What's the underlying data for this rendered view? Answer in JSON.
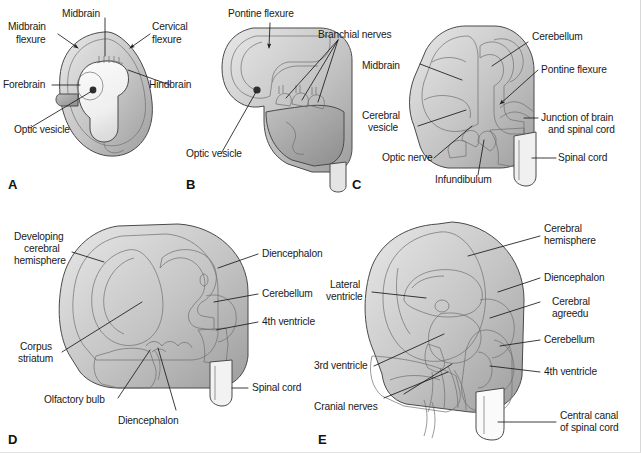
{
  "figure": {
    "background_color": "#ffffff",
    "label_color": "#1a1a1a",
    "outline_color": "#4a4a4a",
    "shade_light": "#f2f2f2",
    "shade_mid": "#c9c9c9",
    "shade_dark": "#9a9a9a"
  },
  "panels": [
    {
      "letter": "A",
      "name": "early-embryo-brain-flexures",
      "labels": [
        {
          "text": "Midbrain",
          "id": "midbrain"
        },
        {
          "text": "Midbrain",
          "id": "midbrain-flexure-line1"
        },
        {
          "text": "flexure",
          "id": "midbrain-flexure-line2"
        },
        {
          "text": "Cervical",
          "id": "cervical-flexure-line1"
        },
        {
          "text": "flexure",
          "id": "cervical-flexure-line2"
        },
        {
          "text": "Forebrain",
          "id": "forebrain"
        },
        {
          "text": "Hindbrain",
          "id": "hindbrain"
        },
        {
          "text": "Optic vesicle",
          "id": "optic-vesicle"
        }
      ]
    },
    {
      "letter": "B",
      "name": "pontine-flexure-stage",
      "labels": [
        {
          "text": "Pontine flexure",
          "id": "pontine-flexure"
        },
        {
          "text": "Branchial nerves",
          "id": "branchial-nerves"
        },
        {
          "text": "Optic vesicle",
          "id": "optic-vesicle"
        }
      ]
    },
    {
      "letter": "C",
      "name": "midbrain-cerebellum-stage",
      "labels": [
        {
          "text": "Cerebellum",
          "id": "cerebellum"
        },
        {
          "text": "Midbrain",
          "id": "midbrain"
        },
        {
          "text": "Pontine flexure",
          "id": "pontine-flexure"
        },
        {
          "text": "Cerebral",
          "id": "cerebral-vesicle-line1"
        },
        {
          "text": "vesicle",
          "id": "cerebral-vesicle-line2"
        },
        {
          "text": "Junction of brain",
          "id": "junction-line1"
        },
        {
          "text": "and spinal cord",
          "id": "junction-line2"
        },
        {
          "text": "Optic nerve",
          "id": "optic-nerve"
        },
        {
          "text": "Infundibulum",
          "id": "infundibulum"
        },
        {
          "text": "Spinal cord",
          "id": "spinal-cord"
        }
      ]
    },
    {
      "letter": "D",
      "name": "developing-cerebral-hemisphere",
      "labels": [
        {
          "text": "Developing",
          "id": "developing-hemisphere-line1"
        },
        {
          "text": "cerebral",
          "id": "developing-hemisphere-line2"
        },
        {
          "text": "hemisphere",
          "id": "developing-hemisphere-line3"
        },
        {
          "text": "Diencephalon",
          "id": "diencephalon-right"
        },
        {
          "text": "Cerebellum",
          "id": "cerebellum"
        },
        {
          "text": "4th ventricle",
          "id": "fourth-ventricle"
        },
        {
          "text": "Corpus",
          "id": "corpus-striatum-line1"
        },
        {
          "text": "striatum",
          "id": "corpus-striatum-line2"
        },
        {
          "text": "Olfactory bulb",
          "id": "olfactory-bulb"
        },
        {
          "text": "Diencephalon",
          "id": "diencephalon-bottom"
        },
        {
          "text": "Spinal cord",
          "id": "spinal-cord"
        }
      ]
    },
    {
      "letter": "E",
      "name": "mature-fetal-brain-sagittal",
      "labels": [
        {
          "text": "Cerebral",
          "id": "cerebral-hemisphere-line1"
        },
        {
          "text": "hemisphere",
          "id": "cerebral-hemisphere-line2"
        },
        {
          "text": "Diencephalon",
          "id": "diencephalon"
        },
        {
          "text": "Cerebral",
          "id": "cerebral-aqueduct-line1"
        },
        {
          "text": "agreedu",
          "id": "cerebral-aqueduct-line2"
        },
        {
          "text": "Cerebellum",
          "id": "cerebellum"
        },
        {
          "text": "4th ventricle",
          "id": "fourth-ventricle"
        },
        {
          "text": "Lateral",
          "id": "lateral-ventricle-line1"
        },
        {
          "text": "ventricle",
          "id": "lateral-ventricle-line2"
        },
        {
          "text": "3rd ventricle",
          "id": "third-ventricle"
        },
        {
          "text": "Cranial nerves",
          "id": "cranial-nerves"
        },
        {
          "text": "Central canal",
          "id": "central-canal-line1"
        },
        {
          "text": "of spinal cord",
          "id": "central-canal-line2"
        }
      ]
    }
  ]
}
